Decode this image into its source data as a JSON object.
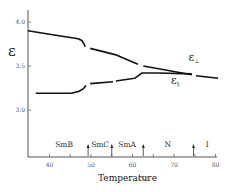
{
  "chart_data": {
    "type": "line",
    "title": "",
    "xlabel": "Temperature",
    "xlabel_unit": "(°C)",
    "ylabel": "ε",
    "xlim": [
      34.8,
      80.3
    ],
    "ylim": [
      2.48,
      4.15
    ],
    "grid": false,
    "legend": "inline labels",
    "x_ticks": [
      40,
      45,
      50,
      55,
      60,
      65,
      70,
      75,
      80
    ],
    "x_tick_labels": [
      {
        "value": 40,
        "label": "40"
      },
      {
        "value": 50,
        "label": "50"
      },
      {
        "value": 60,
        "label": "60"
      },
      {
        "value": 70,
        "label": "70"
      },
      {
        "value": 80,
        "label": "80"
      }
    ],
    "y_ticks": [
      {
        "value": 4.0,
        "label": "4.0"
      },
      {
        "value": 3.5,
        "label": "3.5"
      },
      {
        "value": 3.0,
        "label": "3.0"
      }
    ],
    "series": [
      {
        "name": "ε⊥",
        "label_main": "ε",
        "label_sub": "⊥",
        "label_pos": {
          "x": 73.5,
          "y": 3.56
        },
        "segments": [
          [
            [
              34.8,
              3.9
            ],
            [
              40,
              3.86
            ],
            [
              46.9,
              3.81
            ],
            [
              47.8,
              3.79
            ],
            [
              48.3,
              3.75
            ],
            [
              48.6,
              3.72
            ]
          ],
          [
            [
              49.8,
              3.7
            ],
            [
              55.8,
              3.63
            ],
            [
              61.3,
              3.52
            ]
          ],
          [
            [
              62.6,
              3.5
            ],
            [
              74.3,
              3.4
            ]
          ],
          [
            [
              75.3,
              3.39
            ],
            [
              80.6,
              3.36
            ]
          ]
        ]
      },
      {
        "name": "ε∥",
        "label_main": "ε",
        "label_sub": "∥",
        "label_pos": {
          "x": 69.3,
          "y": 3.3
        },
        "segments": [
          [
            [
              36.7,
              3.19
            ],
            [
              45.2,
              3.19
            ],
            [
              47.0,
              3.21
            ],
            [
              48.1,
              3.24
            ],
            [
              48.8,
              3.28
            ]
          ],
          [
            [
              49.8,
              3.3
            ],
            [
              55.3,
              3.32
            ]
          ],
          [
            [
              56.0,
              3.33
            ],
            [
              60.5,
              3.36
            ],
            [
              61.4,
              3.39
            ],
            [
              62.3,
              3.42
            ],
            [
              66,
              3.42
            ],
            [
              74.3,
              3.41
            ]
          ]
        ]
      }
    ],
    "phases": [
      {
        "label": "SmB",
        "x": 43.5
      },
      {
        "label": "SmC",
        "x": 52.2
      },
      {
        "label": "SmA",
        "x": 58.7
      },
      {
        "label": "N",
        "x": 68.5
      },
      {
        "label": "I",
        "x": 78.0
      }
    ],
    "transitions": [
      49.3,
      55.0,
      62.6,
      74.7
    ]
  }
}
